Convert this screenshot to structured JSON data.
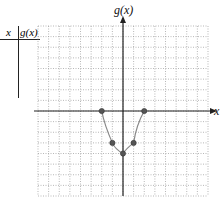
{
  "table": {
    "headers": [
      "x",
      "g(x)"
    ],
    "rows": []
  },
  "chart_data": {
    "type": "line",
    "title": "",
    "xlabel": "x",
    "ylabel": "g(x)",
    "xlim": [
      -8,
      8
    ],
    "ylim": [
      -8,
      8
    ],
    "grid": true,
    "grid_style": "dotted",
    "series": [
      {
        "name": "g(x)",
        "x": [
          -2,
          -1,
          0,
          1,
          2
        ],
        "y": [
          0,
          -3,
          -4,
          -3,
          0
        ],
        "color": "#888888",
        "marker_color": "#555555"
      }
    ]
  }
}
